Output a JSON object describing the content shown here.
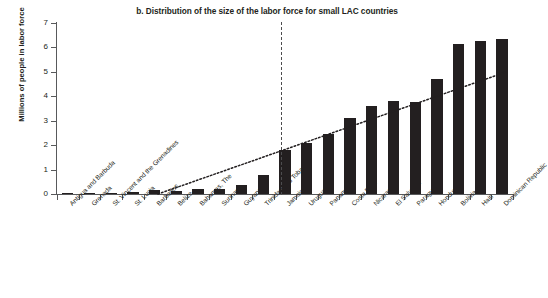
{
  "chart_data": {
    "type": "bar",
    "title": "b. Distribution of the size of the labor force for small LAC countries",
    "xlabel": "",
    "ylabel": "Millions of people in labor force",
    "ylim": [
      0,
      7
    ],
    "yticks": [
      0,
      1,
      2,
      3,
      4,
      5,
      6,
      7
    ],
    "grid": false,
    "legend": "none",
    "bar_color": "#231f20",
    "axis_color": "#58595b",
    "categories": [
      "Antigua and Barbuda",
      "Grenada",
      "St. Vincent and the Grenadines",
      "St. Lucia",
      "Barbados",
      "Belize",
      "Bahamas, The",
      "Suriname",
      "Guyana",
      "Trinidad and Tobago",
      "Jamaica",
      "Uruguay",
      "Panama",
      "Costa Rica",
      "Nicaragua",
      "El Salvador",
      "Paraguay",
      "Honduras",
      "Bolivia",
      "Haiti",
      "Dominican Republic"
    ],
    "values": [
      0.04,
      0.05,
      0.05,
      0.09,
      0.15,
      0.13,
      0.2,
      0.22,
      0.35,
      0.78,
      1.8,
      2.1,
      2.45,
      3.1,
      3.6,
      3.8,
      3.75,
      4.7,
      6.15,
      6.25,
      6.35
    ],
    "annotations": {
      "divider": {
        "style": "vertical dashed line",
        "between": [
          "Trinidad and Tobago",
          "Jamaica"
        ]
      },
      "trendline": {
        "style": "dotted rising line",
        "start_value": 0.0,
        "end_value": 5.0
      }
    }
  }
}
